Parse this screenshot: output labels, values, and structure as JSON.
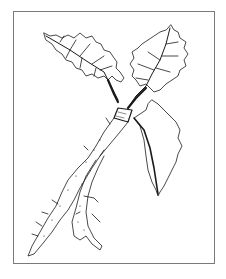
{
  "illustration": {
    "subject": "plant root with two leaves (horseradish-like line drawing)",
    "stroke_color": "#1a1a1a",
    "frame_color": "#7a7a7a",
    "background": "#ffffff"
  }
}
